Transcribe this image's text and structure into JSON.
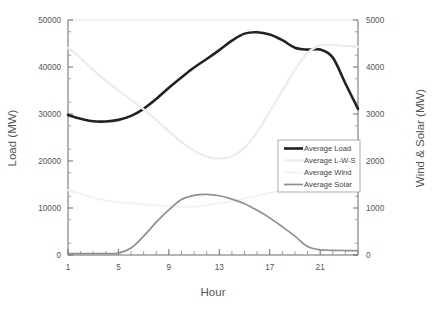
{
  "chart_data": {
    "type": "line",
    "title": "",
    "xlabel": "Hour",
    "ylabel": "Load (MW)",
    "y2label": "Wind & Solar (MW)",
    "x": [
      1,
      2,
      3,
      4,
      5,
      6,
      7,
      8,
      9,
      10,
      11,
      12,
      13,
      14,
      15,
      16,
      17,
      18,
      19,
      20,
      21,
      22,
      23,
      24
    ],
    "xlim": [
      1,
      24
    ],
    "xticks": [
      1,
      5,
      9,
      13,
      17,
      21
    ],
    "xticklabels": [
      "1",
      "5",
      "9",
      "13",
      "17",
      "21"
    ],
    "xminor_ticks": [
      2,
      3,
      4,
      6,
      7,
      8,
      10,
      11,
      12,
      14,
      15,
      16,
      18,
      19,
      20,
      22,
      23,
      24
    ],
    "ylim": [
      0,
      50000
    ],
    "yticks": [
      0,
      10000,
      20000,
      30000,
      40000,
      50000
    ],
    "yticklabels": [
      "0",
      "10000",
      "20000",
      "30000",
      "40000",
      "50000"
    ],
    "y2lim": [
      0,
      5000
    ],
    "y2ticks": [
      0,
      1000,
      2000,
      3000,
      4000,
      5000
    ],
    "y2ticklabels": [
      "0",
      "1000",
      "2000",
      "3000",
      "4000",
      "5000"
    ],
    "grid": false,
    "legend_position": "center-right",
    "series": [
      {
        "name": "Average Load",
        "axis": "left",
        "color": "#222222",
        "width": 2.6,
        "values": [
          29800,
          29000,
          28450,
          28400,
          28750,
          29600,
          31100,
          33200,
          35600,
          37800,
          39900,
          41700,
          43600,
          45600,
          47100,
          47400,
          46900,
          45700,
          44100,
          43700,
          43700,
          42000,
          36500,
          31100
        ]
      },
      {
        "name": "Average L-W-S",
        "axis": "left",
        "color": "#ececec",
        "width": 2.2,
        "values": [
          44100,
          41900,
          39400,
          37100,
          35000,
          33000,
          31000,
          28700,
          26300,
          24000,
          22200,
          20900,
          20500,
          21000,
          22800,
          26200,
          30500,
          35000,
          39400,
          43000,
          44600,
          44700,
          44500,
          44300
        ]
      },
      {
        "name": "Average Wind",
        "axis": "right",
        "color": "#f3f3f3",
        "width": 2.0,
        "values": [
          1380,
          1300,
          1220,
          1160,
          1120,
          1100,
          1080,
          1060,
          1040,
          1020,
          1030,
          1060,
          1100,
          1150,
          1200,
          1260,
          1320,
          1380,
          1440,
          1490,
          1530,
          1550,
          1560,
          1560
        ]
      },
      {
        "name": "Average Solar",
        "axis": "right",
        "color": "#8f8f8f",
        "width": 1.7,
        "values": [
          30,
          30,
          30,
          30,
          40,
          150,
          400,
          700,
          960,
          1180,
          1270,
          1290,
          1260,
          1190,
          1090,
          950,
          790,
          600,
          400,
          180,
          110,
          100,
          95,
          90
        ]
      }
    ],
    "legend": [
      {
        "label": "Average Load",
        "color": "#222222",
        "width": 2.6,
        "swatch": true
      },
      {
        "label": "Average L-W-S",
        "color": "#ececec",
        "width": 2.2,
        "swatch": true
      },
      {
        "label": "Average Wind",
        "color": "#f3f3f3",
        "width": 2.0,
        "swatch": true
      },
      {
        "label": "Average Solar",
        "color": "#8f8f8f",
        "width": 1.7,
        "swatch": true
      }
    ]
  }
}
